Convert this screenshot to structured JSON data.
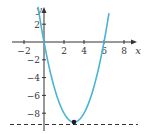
{
  "chart_data": {
    "type": "line",
    "title": "",
    "xlabel": "x",
    "ylabel": "y",
    "xlim": [
      -3,
      9
    ],
    "ylim": [
      -10,
      4
    ],
    "grid": false,
    "x_ticks": [
      -2,
      2,
      4,
      6,
      8
    ],
    "y_ticks": [
      2,
      -2,
      -4,
      -6,
      -8
    ],
    "series": [
      {
        "name": "parabola",
        "equation": "y = x^2 - 6x",
        "color": "#4bb3d6",
        "x": [
          -0.6,
          0,
          1,
          2,
          3,
          4,
          5,
          6,
          6.5
        ],
        "values": [
          3.96,
          0,
          -5,
          -8,
          -9,
          -8,
          -5,
          0,
          3.25
        ]
      },
      {
        "name": "dashed horizontal line",
        "style": "dashed",
        "color": "#333333",
        "y": -9.5
      }
    ],
    "annotations": [
      {
        "type": "point",
        "x": 3,
        "y": -9,
        "label": "vertex"
      }
    ]
  },
  "labels": {
    "x_axis": "x",
    "y_axis": "y",
    "x_ticks": [
      "−2",
      "2",
      "4",
      "6",
      "8"
    ],
    "y_ticks": [
      "2",
      "−2",
      "−4",
      "−6",
      "−8"
    ]
  }
}
